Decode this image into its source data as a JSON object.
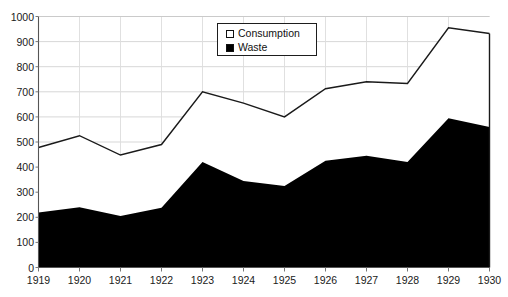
{
  "clipped_top_text": "",
  "legend": {
    "position": "top-center-inside",
    "items": [
      {
        "label": "Consumption",
        "swatch": "hollow-square-icon",
        "color": "#ffffff"
      },
      {
        "label": "Waste",
        "swatch": "filled-square-icon",
        "color": "#000000"
      }
    ]
  },
  "axes": {
    "y_ticks": [
      1000,
      900,
      800,
      700,
      600,
      500,
      400,
      300,
      200,
      100,
      0
    ],
    "x_ticks": [
      1919,
      1920,
      1921,
      1922,
      1923,
      1924,
      1925,
      1926,
      1927,
      1928,
      1929,
      1930
    ]
  },
  "chart_data": {
    "type": "area",
    "stacked": true,
    "title": "",
    "subtitle": "",
    "xlabel": "",
    "ylabel": "",
    "ylim": [
      0,
      1000
    ],
    "ytick_step": 100,
    "grid": "horizontal-only",
    "legend_position": "inside-top-center",
    "categories": [
      1919,
      1920,
      1921,
      1922,
      1923,
      1924,
      1925,
      1926,
      1927,
      1928,
      1929,
      1930
    ],
    "series": [
      {
        "name": "Waste",
        "color": "#000000",
        "fill": "solid-black",
        "values": [
          219,
          240,
          205,
          238,
          420,
          345,
          325,
          425,
          445,
          420,
          595,
          560
        ]
      },
      {
        "name": "Consumption",
        "color": "#ffffff",
        "fill": "white-outlined",
        "note": "plotted as the upper boundary; total = Waste + Consumption",
        "totals": [
          478,
          525,
          448,
          490,
          700,
          655,
          600,
          712,
          740,
          733,
          955,
          932
        ],
        "values": [
          259,
          285,
          243,
          252,
          280,
          310,
          275,
          287,
          295,
          313,
          360,
          372
        ]
      }
    ]
  }
}
